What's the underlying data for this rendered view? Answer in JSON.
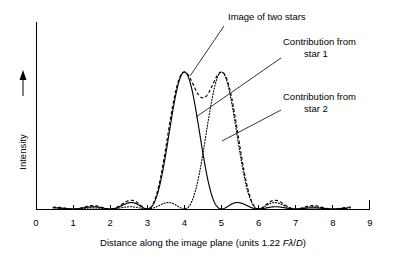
{
  "figure": {
    "title": "",
    "background_color": "#ffffff",
    "ink_color": "#000000"
  },
  "axes": {
    "y_label": "Intensity",
    "y_arrow_icon": "up-arrow-icon",
    "x_label_prefix": "Distance along the image plane (units 1.22 ",
    "x_label_math_F": "F",
    "x_label_math_lambda": "λ",
    "x_label_math_slash": "/",
    "x_label_math_D": "D",
    "x_label_suffix": ")",
    "x_ticks": [
      "0",
      "1",
      "2",
      "3",
      "4",
      "5",
      "6",
      "7",
      "8",
      "9"
    ]
  },
  "annotations": [
    {
      "id": "image-of-two-stars",
      "lines": [
        "Image of two stars"
      ],
      "text_x": 228,
      "text_y": 20,
      "anchor": "start",
      "leader": [
        [
          224,
          26
        ],
        [
          190,
          76
        ]
      ]
    },
    {
      "id": "contribution-star-1",
      "lines": [
        "Contribution from",
        "star 1"
      ],
      "text_x": 283,
      "text_y": 45,
      "anchor": "start",
      "leader": [
        [
          281,
          58
        ],
        [
          196,
          117
        ]
      ]
    },
    {
      "id": "contribution-star-2",
      "lines": [
        "Contribution from",
        "star 2"
      ],
      "text_x": 283,
      "text_y": 100,
      "anchor": "start",
      "leader": [
        [
          281,
          110
        ],
        [
          222,
          141
        ]
      ]
    }
  ],
  "chart_data": {
    "type": "line",
    "xlabel": "Distance along the image plane (units 1.22 Fλ/D)",
    "ylabel": "Intensity",
    "xlim": [
      0,
      9
    ],
    "ylim": [
      0,
      1.12
    ],
    "grid": false,
    "legend": "annotated-labels",
    "x_ticks": [
      0,
      1,
      2,
      3,
      4,
      5,
      6,
      7,
      8,
      9
    ],
    "y_ticks": [],
    "profile_model": "airy_sinc_squared",
    "series": [
      {
        "name": "Contribution from star 1",
        "style": "solid",
        "center": 4.0,
        "peak": 1.0,
        "x_start": 0.45,
        "x_end": 8.4,
        "zeros": [
          1,
          2,
          3,
          5,
          6,
          7,
          8
        ],
        "side_lobe_peaks": [
          {
            "x": 3.47,
            "y": 0.047
          },
          {
            "x": 2.5,
            "y": 0.017
          },
          {
            "x": 1.5,
            "y": 0.009
          },
          {
            "x": 4.5,
            "y": 0.047
          },
          {
            "x": 5.5,
            "y": 0.017
          },
          {
            "x": 6.5,
            "y": 0.009
          }
        ]
      },
      {
        "name": "Contribution from star 2",
        "style": "dotted",
        "center": 5.0,
        "peak": 1.0,
        "x_start": 0.6,
        "x_end": 8.5,
        "zeros": [
          1,
          2,
          3,
          4,
          6,
          7,
          8
        ],
        "side_lobe_peaks": [
          {
            "x": 4.47,
            "y": 0.047
          },
          {
            "x": 3.5,
            "y": 0.017
          },
          {
            "x": 2.5,
            "y": 0.009
          },
          {
            "x": 5.5,
            "y": 0.047
          },
          {
            "x": 6.5,
            "y": 0.017
          },
          {
            "x": 7.5,
            "y": 0.009
          }
        ]
      },
      {
        "name": "Image of two stars",
        "style": "dashed",
        "description": "Sum of star 1 and star 2 contributions",
        "x_start": 0.45,
        "x_end": 8.5,
        "peaks": [
          {
            "x": 4.0,
            "y": 1.03
          },
          {
            "x": 5.0,
            "y": 1.03
          }
        ],
        "saddle": {
          "x": 4.5,
          "y": 0.86
        }
      }
    ],
    "sampled_points": {
      "comment": "Representative intensity values of the summed curve at sampled x positions",
      "x": [
        0.5,
        1.0,
        1.5,
        2.0,
        2.5,
        3.0,
        3.5,
        4.0,
        4.5,
        5.0,
        5.5,
        6.0,
        6.5,
        7.0,
        7.5,
        8.0,
        8.4
      ],
      "sum": [
        0.01,
        0.0,
        0.02,
        0.0,
        0.03,
        0.05,
        0.52,
        1.03,
        0.86,
        1.03,
        0.52,
        0.05,
        0.03,
        0.0,
        0.02,
        0.0,
        0.01
      ],
      "star1": [
        0.01,
        0.0,
        0.01,
        0.0,
        0.02,
        0.0,
        0.47,
        1.0,
        0.41,
        0.0,
        0.02,
        0.0,
        0.01,
        0.0,
        0.005,
        0.0,
        0.004
      ],
      "star2": [
        0.004,
        0.0,
        0.005,
        0.0,
        0.01,
        0.0,
        0.02,
        0.0,
        0.41,
        1.0,
        0.47,
        0.0,
        0.02,
        0.0,
        0.01,
        0.0,
        0.005
      ]
    }
  },
  "geometry": {
    "plot_left": 36,
    "plot_right": 370,
    "baseline_y": 209,
    "peak_y": 72,
    "y_axis_top": 22,
    "unit_px_per_x": 37.1,
    "tick_height": 4
  }
}
